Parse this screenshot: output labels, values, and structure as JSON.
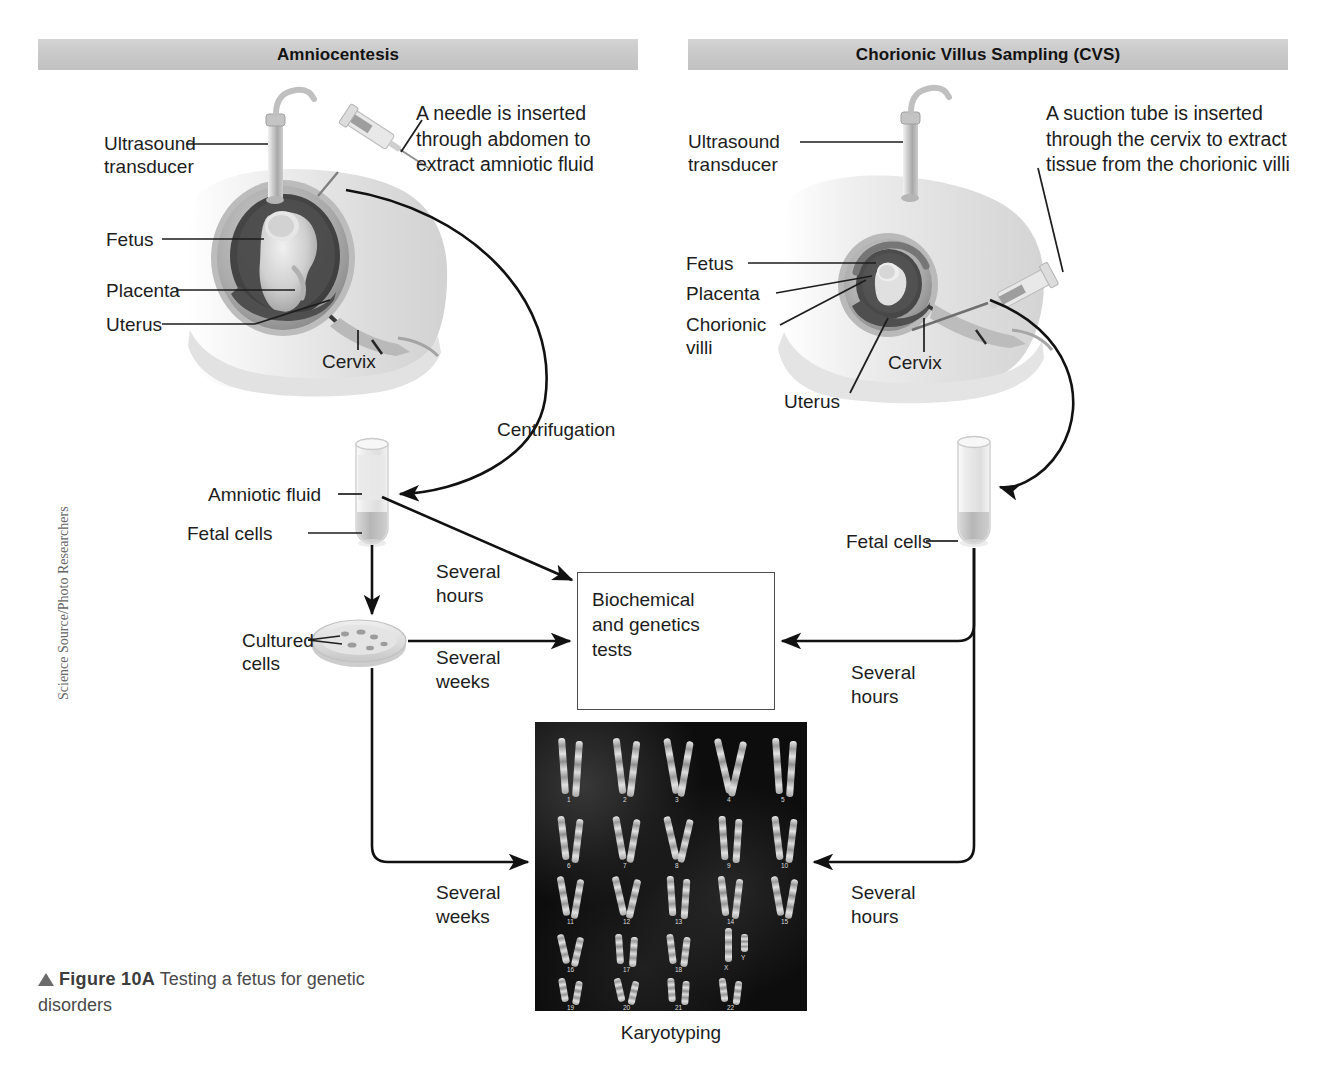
{
  "figure": {
    "number": "Figure 10A",
    "caption": "Testing a fetus for genetic disorders",
    "credit": "Science Source/Photo Researchers"
  },
  "panels": [
    {
      "id": "amniocentesis",
      "title": "Amniocentesis",
      "description": "A needle is inserted\nthrough abdomen to\nextract amniotic fluid",
      "anatomy_labels": [
        {
          "name": "ultrasound-transducer",
          "text": "Ultrasound\ntransducer"
        },
        {
          "name": "fetus",
          "text": "Fetus"
        },
        {
          "name": "placenta",
          "text": "Placenta"
        },
        {
          "name": "uterus",
          "text": "Uterus"
        },
        {
          "name": "cervix",
          "text": "Cervix"
        }
      ],
      "sample_labels": [
        {
          "name": "amniotic-fluid",
          "text": "Amniotic fluid"
        },
        {
          "name": "fetal-cells",
          "text": "Fetal cells"
        },
        {
          "name": "cultured-cells",
          "text": "Cultured\ncells"
        }
      ],
      "process_labels": [
        {
          "name": "centrifugation",
          "text": "Centrifugation"
        },
        {
          "name": "fluid-to-tests",
          "text": "Several\nhours"
        },
        {
          "name": "cultured-to-tests",
          "text": "Several\nweeks"
        },
        {
          "name": "cultured-to-karyotype",
          "text": "Several\nweeks"
        }
      ]
    },
    {
      "id": "chorionic-villus-sampling",
      "title": "Chorionic Villus Sampling (CVS)",
      "description": "A suction tube is inserted\nthrough the cervix to extract\ntissue from the chorionic villi",
      "anatomy_labels": [
        {
          "name": "ultrasound-transducer",
          "text": "Ultrasound\ntransducer"
        },
        {
          "name": "fetus",
          "text": "Fetus"
        },
        {
          "name": "placenta",
          "text": "Placenta"
        },
        {
          "name": "chorionic-villi",
          "text": "Chorionic\nvilli"
        },
        {
          "name": "cervix",
          "text": "Cervix"
        },
        {
          "name": "uterus",
          "text": "Uterus"
        }
      ],
      "sample_labels": [
        {
          "name": "fetal-cells",
          "text": "Fetal cells"
        }
      ],
      "process_labels": [
        {
          "name": "cells-to-tests",
          "text": "Several\nhours"
        },
        {
          "name": "cells-to-karyotype",
          "text": "Several\nhours"
        }
      ]
    }
  ],
  "tests_box": {
    "label": "Biochemical\nand genetics\ntests"
  },
  "karyotype": {
    "label": "Karyotyping",
    "chromosome_numbers": [
      "1",
      "2",
      "3",
      "4",
      "5",
      "6",
      "7",
      "8",
      "9",
      "10",
      "11",
      "12",
      "13",
      "14",
      "15",
      "16",
      "17",
      "18",
      "19",
      "20",
      "21",
      "22"
    ],
    "sex_chromosomes": [
      "X",
      "Y"
    ]
  },
  "colors": {
    "header_bar": "#c9c9c9",
    "text": "#1d1d1d",
    "box_border": "#4c4c4c",
    "karyotype_bg": "#0d0d0d",
    "caption_text": "#4a4a4a"
  }
}
